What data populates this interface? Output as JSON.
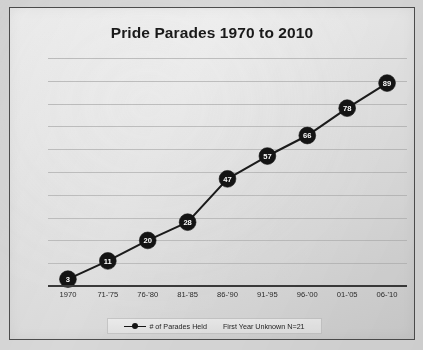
{
  "chart_data": {
    "type": "line",
    "title": "Pride Parades 1970 to 2010",
    "xlabel": "",
    "ylabel": "",
    "categories": [
      "1970",
      "71-'75",
      "76-'80",
      "81-'85",
      "86-'90",
      "91-'95",
      "96-'00",
      "01-'05",
      "06-'10"
    ],
    "values": [
      3,
      11,
      20,
      28,
      47,
      57,
      66,
      78,
      89
    ],
    "series": [
      {
        "name": "# of Parades Held",
        "values": [
          3,
          11,
          20,
          28,
          47,
          57,
          66,
          78,
          89
        ]
      }
    ],
    "ylim": [
      0,
      100
    ],
    "grid": true,
    "gridline_count": 10,
    "legend_position": "bottom",
    "data_labels": [
      "3",
      "11",
      "20",
      "28",
      "47",
      "57",
      "66",
      "78",
      "89"
    ],
    "marker_style": "filled-circle",
    "marker_color": "#141414",
    "line_color": "#1b1b1b",
    "annotations": [
      "First Year Unknown N=21"
    ]
  },
  "legend": {
    "series_label": "# of Parades Held",
    "note_label": "First Year Unknown N=21"
  },
  "colors": {
    "page_background": "#d8d8d8",
    "chart_background": "#eaeaea",
    "border": "#4d4d4d",
    "gridline": "#b9b9b9",
    "axis": "#3a3a3a",
    "marker": "#141414",
    "marker_text": "#ffffff",
    "title_text": "#1a1a1a",
    "tick_text": "#2b2b2b"
  }
}
